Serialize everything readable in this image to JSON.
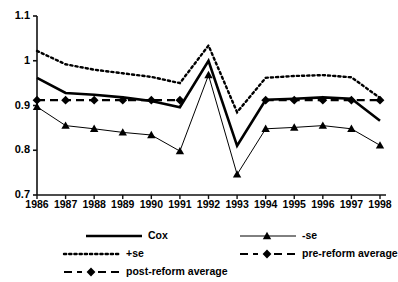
{
  "chart_data": {
    "type": "line",
    "title": "",
    "xlabel": "",
    "ylabel": "",
    "categories": [
      "1986",
      "1987",
      "1988",
      "1989",
      "1990",
      "1991",
      "1992",
      "1993",
      "1994",
      "1995",
      "1996",
      "1997",
      "1998"
    ],
    "x": [
      1986,
      1987,
      1988,
      1989,
      1990,
      1991,
      1992,
      1993,
      1994,
      1995,
      1996,
      1997,
      1998
    ],
    "ylim": [
      0.7,
      1.1
    ],
    "yticks": [
      0.7,
      0.8,
      0.9,
      1.0,
      1.1
    ],
    "ytick_labels": [
      "0.7",
      "0.8",
      "0.9",
      "1",
      "1.1"
    ],
    "grid": false,
    "legend_position": "bottom",
    "series": [
      {
        "name": "Cox",
        "style": "solid",
        "marker": "none",
        "color": "#000000",
        "values": [
          0.962,
          0.928,
          0.924,
          0.918,
          0.91,
          0.896,
          1.0,
          0.81,
          0.913,
          0.915,
          0.918,
          0.915,
          0.866
        ]
      },
      {
        "name": "+se",
        "style": "dotted",
        "marker": "none",
        "color": "#000000",
        "values": [
          1.022,
          0.992,
          0.98,
          0.972,
          0.964,
          0.95,
          1.034,
          0.885,
          0.962,
          0.966,
          0.968,
          0.963,
          0.917
        ]
      },
      {
        "name": "-se",
        "style": "thin-solid",
        "marker": "triangle",
        "color": "#000000",
        "values": [
          0.897,
          0.855,
          0.848,
          0.84,
          0.834,
          0.798,
          0.968,
          0.746,
          0.848,
          0.851,
          0.855,
          0.848,
          0.811
        ]
      },
      {
        "name": "pre-reform average",
        "style": "dashed",
        "marker": "diamond",
        "color": "#000000",
        "values": [
          0.912,
          0.912,
          0.912,
          0.912,
          0.912,
          0.912,
          null,
          null,
          null,
          null,
          null,
          null,
          null
        ]
      },
      {
        "name": "post-reform average",
        "style": "dashed",
        "marker": "diamond",
        "color": "#000000",
        "values": [
          null,
          null,
          null,
          null,
          null,
          null,
          null,
          null,
          0.912,
          0.912,
          0.912,
          0.912,
          0.912
        ]
      }
    ],
    "legend": [
      {
        "label": "Cox",
        "style": "solid",
        "marker": "none"
      },
      {
        "label": "-se",
        "style": "thin-solid",
        "marker": "triangle"
      },
      {
        "label": "+se",
        "style": "dotted",
        "marker": "none"
      },
      {
        "label": "pre-reform average",
        "style": "dashed",
        "marker": "diamond"
      },
      {
        "label": "post-reform average",
        "style": "dashed",
        "marker": "diamond"
      }
    ]
  }
}
